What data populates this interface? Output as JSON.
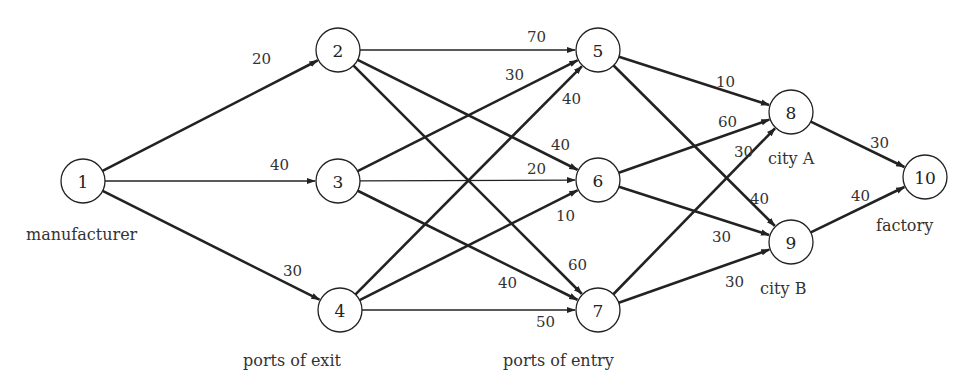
{
  "diagram": {
    "type": "directed-network",
    "node_radius": 22,
    "nodes": [
      {
        "id": "1",
        "x": 83,
        "y": 181
      },
      {
        "id": "2",
        "x": 338,
        "y": 50
      },
      {
        "id": "3",
        "x": 338,
        "y": 181
      },
      {
        "id": "4",
        "x": 340,
        "y": 310
      },
      {
        "id": "5",
        "x": 598,
        "y": 50
      },
      {
        "id": "6",
        "x": 598,
        "y": 180
      },
      {
        "id": "7",
        "x": 598,
        "y": 310
      },
      {
        "id": "8",
        "x": 791,
        "y": 112
      },
      {
        "id": "9",
        "x": 791,
        "y": 242
      },
      {
        "id": "10",
        "x": 925,
        "y": 177
      }
    ],
    "edges": [
      {
        "from": "1",
        "to": "2",
        "label": "20",
        "lx": 252,
        "ly": 64,
        "bold": true
      },
      {
        "from": "1",
        "to": "3",
        "label": "40",
        "lx": 270,
        "ly": 170,
        "bold": false
      },
      {
        "from": "1",
        "to": "4",
        "label": "30",
        "lx": 283,
        "ly": 276,
        "bold": true
      },
      {
        "from": "2",
        "to": "5",
        "label": "70",
        "lx": 527,
        "ly": 42,
        "bold": false
      },
      {
        "from": "2",
        "to": "6",
        "label": "40",
        "lx": 551,
        "ly": 150,
        "bold": true
      },
      {
        "from": "2",
        "to": "7",
        "label": "60",
        "lx": 568,
        "ly": 270,
        "bold": true
      },
      {
        "from": "3",
        "to": "5",
        "label": "30",
        "lx": 505,
        "ly": 80,
        "bold": true
      },
      {
        "from": "3",
        "to": "6",
        "label": "20",
        "lx": 527,
        "ly": 174,
        "bold": false
      },
      {
        "from": "3",
        "to": "7",
        "label": "40",
        "lx": 498,
        "ly": 288,
        "bold": true
      },
      {
        "from": "4",
        "to": "5",
        "label": "40",
        "lx": 562,
        "ly": 104,
        "bold": true
      },
      {
        "from": "4",
        "to": "6",
        "label": "10",
        "lx": 556,
        "ly": 221,
        "bold": true
      },
      {
        "from": "4",
        "to": "7",
        "label": "50",
        "lx": 536,
        "ly": 327,
        "bold": false
      },
      {
        "from": "5",
        "to": "8",
        "label": "10",
        "lx": 716,
        "ly": 87,
        "bold": true
      },
      {
        "from": "5",
        "to": "9",
        "label": "40",
        "lx": 750,
        "ly": 204,
        "bold": true
      },
      {
        "from": "6",
        "to": "8",
        "label": "60",
        "lx": 718,
        "ly": 127,
        "bold": true
      },
      {
        "from": "6",
        "to": "9",
        "label": "30",
        "lx": 712,
        "ly": 242,
        "bold": true
      },
      {
        "from": "7",
        "to": "8",
        "label": "30",
        "lx": 734,
        "ly": 157,
        "bold": true
      },
      {
        "from": "7",
        "to": "9",
        "label": "30",
        "lx": 725,
        "ly": 287,
        "bold": true
      },
      {
        "from": "8",
        "to": "10",
        "label": "30",
        "lx": 870,
        "ly": 148,
        "bold": true
      },
      {
        "from": "9",
        "to": "10",
        "label": "40",
        "lx": 851,
        "ly": 201,
        "bold": true
      }
    ],
    "captions": [
      {
        "id": "manufacturer",
        "text": "manufacturer",
        "x": 26,
        "y": 240
      },
      {
        "id": "ports-of-exit",
        "text": "ports of exit",
        "x": 243,
        "y": 366
      },
      {
        "id": "ports-of-entry",
        "text": "ports of entry",
        "x": 503,
        "y": 366
      },
      {
        "id": "city-a",
        "text": "city A",
        "x": 768,
        "y": 164
      },
      {
        "id": "city-b",
        "text": "city B",
        "x": 760,
        "y": 294
      },
      {
        "id": "factory",
        "text": "factory",
        "x": 876,
        "y": 231
      }
    ]
  }
}
